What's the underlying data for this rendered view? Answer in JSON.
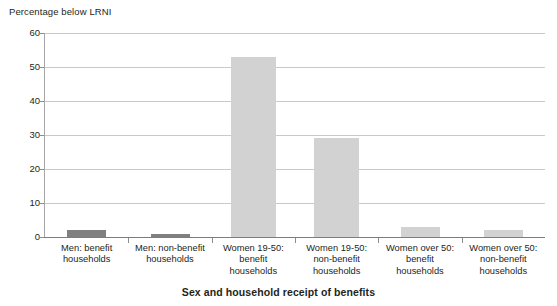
{
  "chart_data": {
    "type": "bar",
    "title": "",
    "ylabel": "Percentage below LRNI",
    "xlabel": "Sex and household receipt of benefits",
    "ylim": [
      0,
      60
    ],
    "ytick_labels": [
      "0",
      "10",
      "20",
      "30",
      "40",
      "50",
      "60"
    ],
    "ytick_values": [
      0,
      10,
      20,
      30,
      40,
      50,
      60
    ],
    "grid": true,
    "legend": "none",
    "categories": [
      "Men: benefit households",
      "Men: non-benefit households",
      "Women 19-50: benefit households",
      "Women 19-50: non-benefit households",
      "Women over 50: benefit households",
      "Women over 50: non-benefit households"
    ],
    "category_lines": [
      [
        "Men: benefit",
        "households"
      ],
      [
        "Men: non-benefit",
        "households"
      ],
      [
        "Women 19-50:",
        "benefit",
        "households"
      ],
      [
        "Women 19-50:",
        "non-benefit",
        "households"
      ],
      [
        "Women over 50:",
        "benefit",
        "households"
      ],
      [
        "Women over 50:",
        "non-benefit",
        "households"
      ]
    ],
    "values": [
      2,
      1,
      53,
      29,
      3,
      2
    ],
    "bar_colors": [
      "#808080",
      "#808080",
      "#d2d2d2",
      "#d2d2d2",
      "#d2d2d2",
      "#d2d2d2"
    ],
    "colors": {
      "bar_dark": "#808080",
      "bar_light": "#d2d2d2",
      "gridline": "#c9c9c9",
      "axis": "#7d7d7d",
      "text": "#231f20",
      "background": "#ffffff"
    }
  }
}
